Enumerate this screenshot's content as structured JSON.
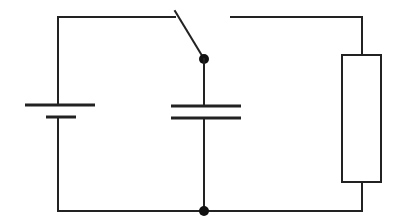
{
  "diagram": {
    "type": "circuit-schematic",
    "stroke_color": "#222222",
    "background": "#ffffff",
    "components": [
      {
        "id": "battery",
        "type": "cell",
        "x": 58,
        "long_plate": {
          "y": 105,
          "x1": 25,
          "x2": 95
        },
        "short_plate": {
          "y": 117,
          "x1": 46,
          "x2": 76
        }
      },
      {
        "id": "switch",
        "type": "spst-switch",
        "state": "open",
        "pivot": [
          204,
          59
        ],
        "arm_end": [
          175,
          11
        ]
      },
      {
        "id": "capacitor",
        "type": "capacitor",
        "x": 204,
        "plate1": {
          "y": 106,
          "x1": 171,
          "x2": 241
        },
        "plate2": {
          "y": 118,
          "x1": 171,
          "x2": 241
        }
      },
      {
        "id": "resistor",
        "type": "resistor",
        "rect": {
          "x": 342,
          "y": 55,
          "w": 39,
          "h": 127
        }
      }
    ],
    "junctions": [
      [
        204,
        59
      ],
      [
        204,
        211
      ]
    ],
    "wires": {
      "top_y": 17,
      "bottom_y": 211,
      "left_x": 58,
      "right_x": 362,
      "top_right_start_x": 231
    }
  }
}
